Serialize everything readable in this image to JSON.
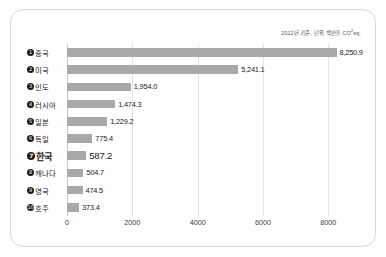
{
  "note": {
    "prefix": "2012년 기준, 단위 백만톤 CO",
    "sup": "2",
    "suffix": "eq."
  },
  "chart_data": {
    "type": "bar",
    "orientation": "horizontal",
    "title": "",
    "subtitle": "2012년 기준, 단위 백만톤 CO2eq.",
    "xlabel": "",
    "ylabel": "",
    "xlim": [
      0,
      9000
    ],
    "xticks": [
      0,
      2000,
      4000,
      6000,
      8000
    ],
    "xtick_labels": [
      "0",
      "2000",
      "4000",
      "6000",
      "8000"
    ],
    "grid": true,
    "legend": false,
    "unit": "백만톤 CO2eq.",
    "year": "2012",
    "bar_color": "#a9a9a9",
    "highlight_index": 6,
    "categories": [
      "중국",
      "미국",
      "인도",
      "러시아",
      "일본",
      "독일",
      "한국",
      "캐나다",
      "영국",
      "호주"
    ],
    "values": [
      8250.9,
      5241.1,
      1954.0,
      1474.3,
      1229.2,
      775.4,
      587.2,
      504.7,
      474.5,
      373.4
    ],
    "rows": [
      {
        "rank": "❶",
        "label": "중국",
        "value": 8250.9,
        "value_label": "8,250.9",
        "highlight": false
      },
      {
        "rank": "❷",
        "label": "미국",
        "value": 5241.1,
        "value_label": "5,241.1",
        "highlight": false
      },
      {
        "rank": "❸",
        "label": "인도",
        "value": 1954.0,
        "value_label": "1,954.0",
        "highlight": false
      },
      {
        "rank": "❹",
        "label": "러시아",
        "value": 1474.3,
        "value_label": "1,474.3",
        "highlight": false
      },
      {
        "rank": "❺",
        "label": "일본",
        "value": 1229.2,
        "value_label": "1,229.2",
        "highlight": false
      },
      {
        "rank": "❻",
        "label": "독일",
        "value": 775.4,
        "value_label": "775.4",
        "highlight": false
      },
      {
        "rank": "❼",
        "label": "한국",
        "value": 587.2,
        "value_label": "587.2",
        "highlight": true
      },
      {
        "rank": "❽",
        "label": "캐나다",
        "value": 504.7,
        "value_label": "504.7",
        "highlight": false
      },
      {
        "rank": "❾",
        "label": "영국",
        "value": 474.5,
        "value_label": "474.5",
        "highlight": false
      },
      {
        "rank": "❿",
        "label": "호주",
        "value": 373.4,
        "value_label": "373.4",
        "highlight": false
      }
    ]
  }
}
